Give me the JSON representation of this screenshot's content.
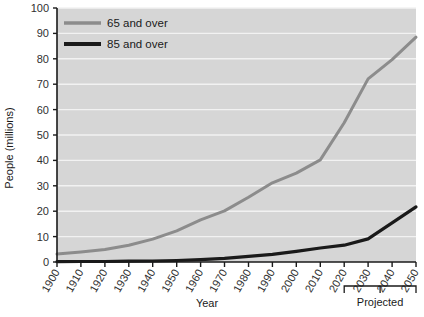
{
  "chart_data": {
    "type": "line",
    "title": "",
    "xlabel": "Year",
    "ylabel": "People (millions)",
    "xlim": [
      1900,
      2050
    ],
    "ylim": [
      0,
      100
    ],
    "grid": true,
    "legend_position": "top-left",
    "categories": [
      1900,
      1910,
      1920,
      1930,
      1940,
      1950,
      1960,
      1970,
      1980,
      1990,
      2000,
      2010,
      2020,
      2030,
      2040,
      2050
    ],
    "series": [
      {
        "name": "65 and over",
        "color": "#8c8c8c",
        "values": [
          3.1,
          3.9,
          4.9,
          6.6,
          9.0,
          12.3,
          16.6,
          20.1,
          25.5,
          31.2,
          35.0,
          40.2,
          54.8,
          72.1,
          79.7,
          88.5
        ]
      },
      {
        "name": "85 and over",
        "color": "#1a1a1a",
        "values": [
          0.1,
          0.2,
          0.2,
          0.3,
          0.4,
          0.6,
          0.9,
          1.4,
          2.2,
          3.0,
          4.2,
          5.5,
          6.6,
          9.1,
          15.4,
          21.7
        ]
      }
    ],
    "xtick_labels": [
      "1900",
      "1910",
      "1920",
      "1930",
      "1940",
      "1950",
      "1960",
      "1970",
      "1980",
      "1990",
      "2000",
      "2010",
      "2020",
      "2030",
      "2040",
      "2050"
    ],
    "ytick_labels": [
      "0",
      "10",
      "20",
      "30",
      "40",
      "50",
      "60",
      "70",
      "80",
      "90",
      "100"
    ],
    "ytick_values": [
      0,
      10,
      20,
      30,
      40,
      50,
      60,
      70,
      80,
      90,
      100
    ],
    "annotations": [
      {
        "name": "projected-bracket",
        "label": "Projected",
        "from_year": 2020,
        "to_year": 2050
      }
    ],
    "plot_background": "#d6d6d6",
    "gridline_color": "#f2f2f2",
    "axis_color": "#1a1a1a"
  },
  "legend": {
    "items": [
      {
        "label": "65 and over",
        "color": "#8c8c8c"
      },
      {
        "label": "85 and over",
        "color": "#1a1a1a"
      }
    ]
  },
  "axes": {
    "x_title": "Year",
    "y_title": "People (millions)"
  },
  "annotation": {
    "projected": "Projected"
  }
}
